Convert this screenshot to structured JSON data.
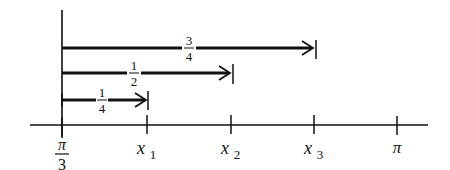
{
  "diagram": {
    "type": "number-line-with-arrows",
    "axis": {
      "ticks": [
        {
          "id": "pi-over-3",
          "numerator": "π",
          "denominator": "3",
          "x": 62
        },
        {
          "id": "x1",
          "base": "x",
          "subscript": "1",
          "x": 147
        },
        {
          "id": "x2",
          "base": "x",
          "subscript": "2",
          "x": 231
        },
        {
          "id": "x3",
          "base": "x",
          "subscript": "3",
          "x": 314
        },
        {
          "id": "pi",
          "label": "π",
          "x": 397
        }
      ]
    },
    "arrows": [
      {
        "id": "three-quarters",
        "numerator": "3",
        "denominator": "4",
        "from": "π/3",
        "to": "x3"
      },
      {
        "id": "one-half",
        "numerator": "1",
        "denominator": "2",
        "from": "π/3",
        "to": "x2"
      },
      {
        "id": "one-quarter",
        "numerator": "1",
        "denominator": "4",
        "from": "π/3",
        "to": "x1"
      }
    ],
    "colors": {
      "ink": "#111111",
      "background": "#ffffff"
    }
  }
}
